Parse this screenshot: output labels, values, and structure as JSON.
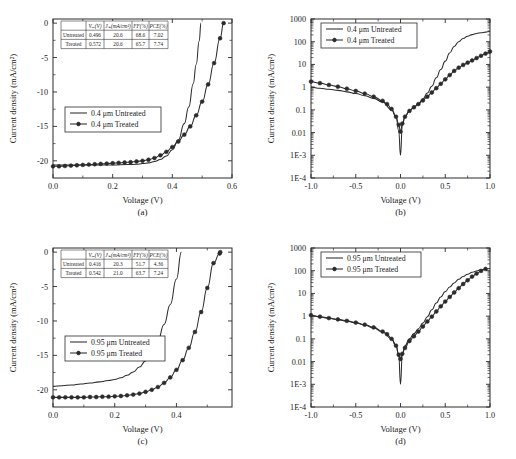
{
  "figure": {
    "panels": [
      {
        "id": "a",
        "caption": "(a)",
        "xlabel": "Voltage (V)",
        "ylabel": "Current density (mA/cm²)",
        "legend": [
          "0.4 μm Untreated",
          "0.4 μm Treated"
        ],
        "table": {
          "headers": [
            "",
            "Vₒₑ(V)",
            "Jₛₑ(mA/cm²)",
            "FF(%)",
            "PCE(%)"
          ],
          "rows": [
            [
              "Untreated",
              "0.496",
              "20.6",
              "68.6",
              "7.02"
            ],
            [
              "Treated",
              "0.572",
              "20.6",
              "65.7",
              "7.74"
            ]
          ]
        }
      },
      {
        "id": "b",
        "caption": "(b)",
        "xlabel": "Voltage (V)",
        "ylabel": "Current density (mA/cm²)",
        "legend": [
          "0.4 μm Untreated",
          "0.4 μm Treated"
        ]
      },
      {
        "id": "c",
        "caption": "(c)",
        "xlabel": "Voltage (V)",
        "ylabel": "Current density (mA/cm²)",
        "legend": [
          "0.95 μm Untreated",
          "0.95 μm Treated"
        ],
        "table": {
          "headers": [
            "",
            "Vₒₑ(V)",
            "Jₛₑ(mA/cm²)",
            "FF(%)",
            "PCE(%)"
          ],
          "rows": [
            [
              "Untreated",
              "0.416",
              "20.3",
              "51.7",
              "4.36"
            ],
            [
              "Treated",
              "0.542",
              "21.0",
              "63.7",
              "7.24"
            ]
          ]
        }
      },
      {
        "id": "d",
        "caption": "(d)",
        "xlabel": "Voltage (V)",
        "ylabel": "Current density (mA/cm²)",
        "legend": [
          "0.95 μm Untreated",
          "0.95 μm Treated"
        ]
      }
    ]
  },
  "chart_data": [
    {
      "type": "line",
      "panel": "a",
      "title": "",
      "xlabel": "Voltage (V)",
      "ylabel": "Current density (mA/cm²)",
      "xlim": [
        0.0,
        0.6
      ],
      "ylim": [
        -22.5,
        0.6
      ],
      "xticks": [
        "0.0",
        "0.2",
        "0.4",
        "0.6"
      ],
      "xtick_values": [
        0.0,
        0.2,
        0.4,
        0.6
      ],
      "yticks": [
        "0",
        "-5",
        "-10",
        "-15",
        "-20"
      ],
      "ytick_values": [
        0,
        -5,
        -10,
        -15,
        -20
      ],
      "grid": false,
      "legend_position": "center-left",
      "series": [
        {
          "name": "0.4 μm Untreated",
          "markers": false,
          "x": [
            0.0,
            0.05,
            0.1,
            0.15,
            0.2,
            0.25,
            0.28,
            0.3,
            0.32,
            0.34,
            0.36,
            0.38,
            0.4,
            0.42,
            0.44,
            0.455,
            0.47,
            0.48,
            0.49,
            0.496
          ],
          "y": [
            -20.6,
            -20.6,
            -20.6,
            -20.6,
            -20.6,
            -20.55,
            -20.5,
            -20.4,
            -20.3,
            -20.1,
            -19.8,
            -19.3,
            -18.4,
            -17.0,
            -14.6,
            -12.2,
            -8.8,
            -6.0,
            -2.6,
            0.0
          ]
        },
        {
          "name": "0.4 μm Treated",
          "markers": true,
          "x": [
            0.0,
            0.02,
            0.04,
            0.06,
            0.08,
            0.1,
            0.12,
            0.14,
            0.16,
            0.18,
            0.2,
            0.22,
            0.24,
            0.26,
            0.28,
            0.3,
            0.32,
            0.34,
            0.36,
            0.38,
            0.4,
            0.42,
            0.44,
            0.46,
            0.48,
            0.5,
            0.52,
            0.54,
            0.56,
            0.572
          ],
          "y": [
            -20.8,
            -20.8,
            -20.75,
            -20.7,
            -20.65,
            -20.6,
            -20.55,
            -20.5,
            -20.45,
            -20.4,
            -20.35,
            -20.3,
            -20.25,
            -20.2,
            -20.1,
            -20.0,
            -19.85,
            -19.6,
            -19.2,
            -18.7,
            -18.0,
            -17.2,
            -16.2,
            -15.0,
            -13.4,
            -11.4,
            -8.9,
            -5.8,
            -2.2,
            0.0
          ]
        }
      ]
    },
    {
      "type": "line",
      "panel": "b",
      "title": "",
      "xlabel": "Voltage (V)",
      "ylabel": "Current density (mA/cm²)",
      "xlim": [
        -1.0,
        1.0
      ],
      "ylim_log": [
        0.0001,
        1000
      ],
      "xticks": [
        "-1.0",
        "-0.5",
        "0.0",
        "0.5",
        "1.0"
      ],
      "xtick_values": [
        -1.0,
        -0.5,
        0.0,
        0.5,
        1.0
      ],
      "yticks": [
        "1000",
        "100",
        "10",
        "1",
        "0.1",
        "0.01",
        "1E-3",
        "1E-4"
      ],
      "ytick_values": [
        1000,
        100,
        10,
        1,
        0.1,
        0.01,
        0.001,
        0.0001
      ],
      "yscale": "log",
      "grid": false,
      "legend_position": "upper-left",
      "series": [
        {
          "name": "0.4 μm Untreated",
          "markers": false,
          "x": [
            -1.0,
            -0.9,
            -0.8,
            -0.7,
            -0.6,
            -0.5,
            -0.4,
            -0.3,
            -0.2,
            -0.1,
            -0.05,
            -0.02,
            0.0,
            0.02,
            0.05,
            0.1,
            0.15,
            0.2,
            0.25,
            0.3,
            0.35,
            0.4,
            0.45,
            0.5,
            0.55,
            0.6,
            0.65,
            0.7,
            0.75,
            0.8,
            0.85,
            0.9,
            0.95,
            1.0
          ],
          "y": [
            1.0,
            0.9,
            0.8,
            0.72,
            0.62,
            0.52,
            0.42,
            0.32,
            0.22,
            0.1,
            0.05,
            0.012,
            0.001,
            0.02,
            0.05,
            0.09,
            0.13,
            0.19,
            0.3,
            0.55,
            1.1,
            2.6,
            6.0,
            14,
            32,
            62,
            100,
            140,
            175,
            205,
            230,
            250,
            265,
            280
          ]
        },
        {
          "name": "0.4 μm Treated",
          "markers": true,
          "x": [
            -1.0,
            -0.9,
            -0.8,
            -0.7,
            -0.6,
            -0.5,
            -0.4,
            -0.3,
            -0.2,
            -0.15,
            -0.1,
            -0.05,
            -0.02,
            0.0,
            0.02,
            0.05,
            0.1,
            0.15,
            0.2,
            0.25,
            0.3,
            0.35,
            0.4,
            0.45,
            0.5,
            0.55,
            0.6,
            0.65,
            0.7,
            0.75,
            0.8,
            0.85,
            0.9,
            0.95,
            1.0
          ],
          "y": [
            1.75,
            1.5,
            1.25,
            1.05,
            0.85,
            0.68,
            0.52,
            0.38,
            0.25,
            0.18,
            0.11,
            0.05,
            0.022,
            0.011,
            0.025,
            0.05,
            0.09,
            0.13,
            0.18,
            0.26,
            0.38,
            0.58,
            0.9,
            1.4,
            2.2,
            3.4,
            5.2,
            7.2,
            9.5,
            12,
            15,
            19,
            24,
            30,
            37
          ]
        }
      ]
    },
    {
      "type": "line",
      "panel": "c",
      "title": "",
      "xlabel": "Voltage (V)",
      "ylabel": "Current density (mA/cm²)",
      "xlim": [
        0.0,
        0.58
      ],
      "ylim": [
        -22.5,
        0.6
      ],
      "xticks": [
        "0.0",
        "0.2",
        "0.4"
      ],
      "xtick_values": [
        0.0,
        0.2,
        0.4
      ],
      "yticks": [
        "0",
        "-5",
        "-10",
        "-15",
        "-20"
      ],
      "ytick_values": [
        0,
        -5,
        -10,
        -15,
        -20
      ],
      "grid": false,
      "legend_position": "center-left",
      "series": [
        {
          "name": "0.95 μm Untreated",
          "markers": false,
          "x": [
            0.0,
            0.03,
            0.06,
            0.09,
            0.12,
            0.15,
            0.18,
            0.2,
            0.22,
            0.24,
            0.26,
            0.28,
            0.3,
            0.32,
            0.34,
            0.36,
            0.38,
            0.4,
            0.416
          ],
          "y": [
            -19.5,
            -19.4,
            -19.3,
            -19.15,
            -19.0,
            -18.85,
            -18.65,
            -18.5,
            -18.25,
            -17.9,
            -17.4,
            -16.7,
            -15.8,
            -14.5,
            -12.8,
            -10.5,
            -7.6,
            -3.9,
            0.0
          ]
        },
        {
          "name": "0.95 μm Treated",
          "markers": true,
          "x": [
            0.0,
            0.02,
            0.04,
            0.06,
            0.08,
            0.1,
            0.12,
            0.14,
            0.16,
            0.18,
            0.2,
            0.22,
            0.24,
            0.26,
            0.28,
            0.3,
            0.32,
            0.34,
            0.36,
            0.38,
            0.4,
            0.42,
            0.44,
            0.46,
            0.48,
            0.5,
            0.52,
            0.54,
            0.542
          ],
          "y": [
            -21.1,
            -21.1,
            -21.1,
            -21.1,
            -21.1,
            -21.1,
            -21.05,
            -21.05,
            -21.0,
            -21.0,
            -20.95,
            -20.9,
            -20.8,
            -20.7,
            -20.55,
            -20.3,
            -20.0,
            -19.6,
            -19.0,
            -18.2,
            -17.1,
            -15.7,
            -13.9,
            -11.6,
            -8.7,
            -5.2,
            -1.6,
            -0.2,
            0.0
          ]
        }
      ]
    },
    {
      "type": "line",
      "panel": "d",
      "title": "",
      "xlabel": "Voltage (V)",
      "ylabel": "Current density (mA/cm²)",
      "xlim": [
        -1.0,
        1.0
      ],
      "ylim_log": [
        0.0001,
        1000
      ],
      "xticks": [
        "-1.0",
        "-0.5",
        "0.0",
        "0.5",
        "1.0"
      ],
      "xtick_values": [
        -1.0,
        -0.5,
        0.0,
        0.5,
        1.0
      ],
      "yticks": [
        "1000",
        "100",
        "10",
        "1",
        "0.1",
        "0.01",
        "1E-3",
        "1E-4"
      ],
      "ytick_values": [
        1000,
        100,
        10,
        1,
        0.1,
        0.01,
        0.001,
        0.0001
      ],
      "yscale": "log",
      "grid": false,
      "legend_position": "upper-left",
      "series": [
        {
          "name": "0.95 μm Untreated",
          "markers": false,
          "x": [
            -1.0,
            -0.9,
            -0.8,
            -0.7,
            -0.6,
            -0.5,
            -0.4,
            -0.3,
            -0.2,
            -0.1,
            -0.05,
            -0.02,
            0.0,
            0.02,
            0.05,
            0.1,
            0.15,
            0.2,
            0.25,
            0.3,
            0.35,
            0.4,
            0.45,
            0.5,
            0.55,
            0.6,
            0.65,
            0.7,
            0.75,
            0.8,
            0.85,
            0.9,
            0.95,
            1.0
          ],
          "y": [
            1.05,
            0.92,
            0.8,
            0.7,
            0.6,
            0.5,
            0.4,
            0.3,
            0.2,
            0.1,
            0.05,
            0.02,
            0.001,
            0.02,
            0.05,
            0.1,
            0.17,
            0.28,
            0.5,
            0.95,
            1.9,
            3.8,
            7.0,
            12,
            19,
            29,
            42,
            56,
            70,
            85,
            98,
            110,
            118,
            125
          ]
        },
        {
          "name": "0.95 μm Treated",
          "markers": true,
          "x": [
            -1.0,
            -0.9,
            -0.8,
            -0.7,
            -0.6,
            -0.5,
            -0.4,
            -0.3,
            -0.2,
            -0.15,
            -0.1,
            -0.05,
            -0.02,
            0.0,
            0.02,
            0.05,
            0.1,
            0.15,
            0.2,
            0.25,
            0.3,
            0.35,
            0.4,
            0.45,
            0.5,
            0.55,
            0.6,
            0.65,
            0.7,
            0.75,
            0.8,
            0.85,
            0.9,
            0.95,
            1.0
          ],
          "y": [
            1.1,
            0.95,
            0.82,
            0.72,
            0.62,
            0.52,
            0.42,
            0.32,
            0.21,
            0.16,
            0.1,
            0.05,
            0.02,
            0.013,
            0.022,
            0.04,
            0.08,
            0.13,
            0.21,
            0.35,
            0.58,
            0.95,
            1.6,
            2.7,
            4.4,
            7.0,
            11,
            17,
            26,
            38,
            55,
            75,
            98,
            120
          ]
        }
      ]
    }
  ]
}
